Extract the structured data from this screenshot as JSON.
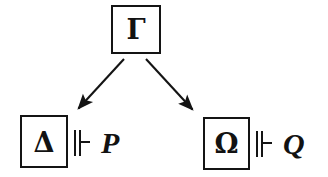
{
  "figure": {
    "background_color": "#ffffff",
    "stroke_color": "#141414",
    "width": 328,
    "height": 177
  },
  "nodes": {
    "top": {
      "id": "gamma",
      "label": "Γ",
      "name": "Gamma",
      "box": {
        "x": 111,
        "y": 5,
        "w": 50,
        "h": 49
      }
    },
    "left": {
      "id": "delta",
      "label": "Δ",
      "name": "Delta",
      "box": {
        "x": 20,
        "y": 115,
        "w": 48,
        "h": 53
      }
    },
    "right": {
      "id": "omega",
      "label": "Ω",
      "name": "Omega",
      "box": {
        "x": 203,
        "y": 117,
        "w": 47,
        "h": 53
      }
    }
  },
  "relations": [
    {
      "id": "left-relation",
      "symbol": "⊩",
      "symbol_name": "forces-turnstile",
      "formula": "P"
    },
    {
      "id": "right-relation",
      "symbol": "⊩",
      "symbol_name": "forces-turnstile",
      "formula": "Q"
    }
  ],
  "edges": [
    {
      "id": "gamma-to-delta",
      "from": "gamma",
      "to": "delta",
      "x1": 124,
      "y1": 59,
      "x2": 77,
      "y2": 110,
      "arrowhead": "filled-triangle"
    },
    {
      "id": "gamma-to-omega",
      "from": "gamma",
      "to": "omega",
      "x1": 146,
      "y1": 59,
      "x2": 194,
      "y2": 111,
      "arrowhead": "filled-triangle"
    }
  ]
}
